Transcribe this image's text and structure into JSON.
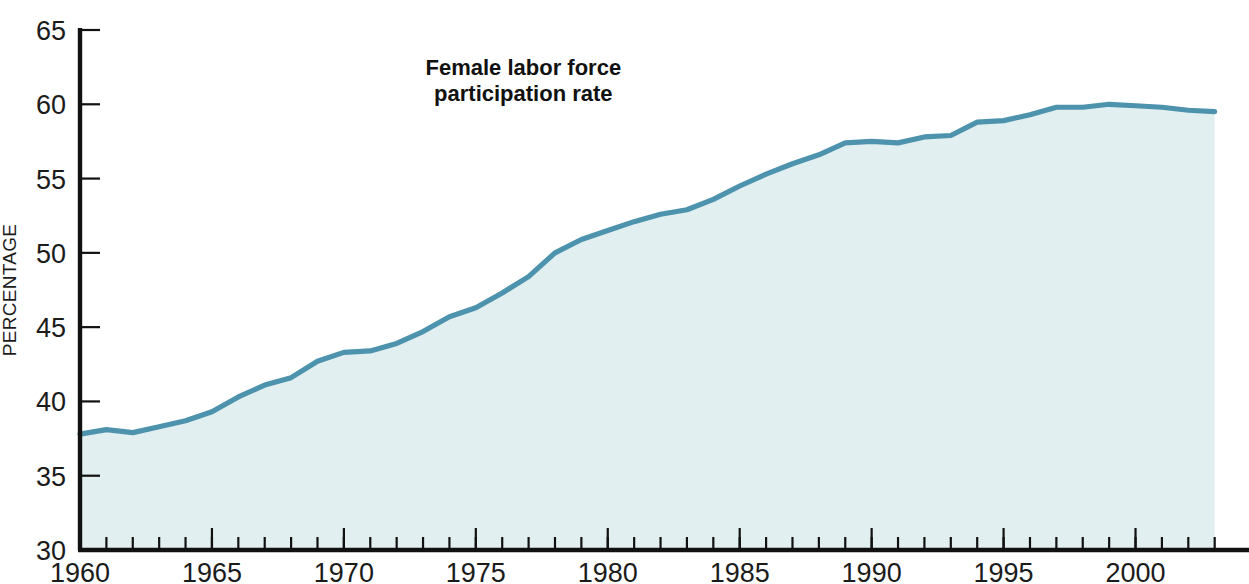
{
  "chart_data": {
    "type": "area",
    "title": "",
    "annotations": [
      {
        "id": "series-callout",
        "line1": "Female labor force",
        "line2": "participation rate",
        "x": 1976.8,
        "y": 62.0
      }
    ],
    "xlabel": "",
    "ylabel": "PERCENTAGE",
    "xlim": [
      1960,
      2004.3
    ],
    "ylim": [
      30,
      65
    ],
    "yticks": [
      30,
      35,
      40,
      45,
      50,
      55,
      60,
      65
    ],
    "ytick_labels": [
      "30",
      "35",
      "40",
      "45",
      "50",
      "55",
      "60",
      "65"
    ],
    "xticks": [
      1960,
      1965,
      1970,
      1975,
      1980,
      1985,
      1990,
      1995,
      2000
    ],
    "xtick_labels": [
      "1960",
      "1965",
      "1970",
      "1975",
      "1980",
      "1985",
      "1990",
      "1995",
      "2000"
    ],
    "x_minor_tick_step": 1,
    "grid": false,
    "legend_position": "none",
    "line_color": "#4e93ad",
    "fill_color": "#e1eff0",
    "axis_color": "#111111",
    "series": [
      {
        "name": "Female labor force participation rate",
        "x": [
          1960,
          1961,
          1962,
          1963,
          1964,
          1965,
          1966,
          1967,
          1968,
          1969,
          1970,
          1971,
          1972,
          1973,
          1974,
          1975,
          1976,
          1977,
          1978,
          1979,
          1980,
          1981,
          1982,
          1983,
          1984,
          1985,
          1986,
          1987,
          1988,
          1989,
          1990,
          1991,
          1992,
          1993,
          1994,
          1995,
          1996,
          1997,
          1998,
          1999,
          2000,
          2001,
          2002,
          2003
        ],
        "values": [
          37.8,
          38.1,
          37.9,
          38.3,
          38.7,
          39.3,
          40.3,
          41.1,
          41.6,
          42.7,
          43.3,
          43.4,
          43.9,
          44.7,
          45.7,
          46.3,
          47.3,
          48.4,
          50.0,
          50.9,
          51.5,
          52.1,
          52.6,
          52.9,
          53.6,
          54.5,
          55.3,
          56.0,
          56.6,
          57.4,
          57.5,
          57.4,
          57.8,
          57.9,
          58.8,
          58.9,
          59.3,
          59.8,
          59.8,
          60.0,
          59.9,
          59.8,
          59.6,
          59.5
        ]
      }
    ]
  },
  "axis": {
    "y_title": "PERCENTAGE"
  }
}
